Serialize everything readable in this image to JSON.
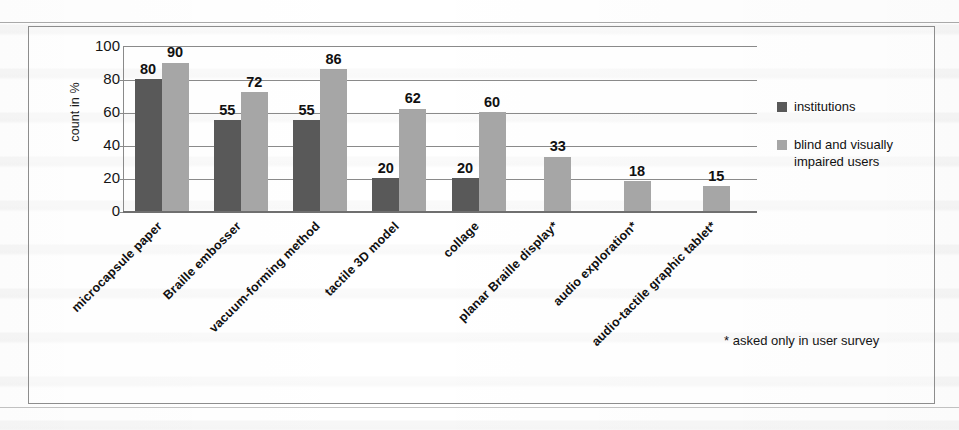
{
  "figure": {
    "footnote": "* asked only in user survey"
  },
  "chart_data": {
    "type": "bar",
    "title": "",
    "xlabel": "",
    "ylabel": "count in %",
    "ylim": [
      0,
      100
    ],
    "yticks": [
      0,
      20,
      40,
      60,
      80,
      100
    ],
    "ytick_labels": [
      "0",
      "20",
      "40",
      "60",
      "80",
      "100"
    ],
    "grid": true,
    "legend_position": "right",
    "categories": [
      "microcapsule paper",
      "Braille embosser",
      "vacuum-forming method",
      "tactile 3D model",
      "collage",
      "planar Braille display*",
      "audio exploration*",
      "audio-tactile graphic tablet*"
    ],
    "series": [
      {
        "name": "institutions",
        "color": "#595959",
        "values": [
          80,
          55,
          55,
          20,
          20,
          null,
          null,
          null
        ],
        "labels": [
          "80",
          "55",
          "55",
          "20",
          "20",
          "",
          "",
          ""
        ]
      },
      {
        "name": "blind and visually impaired users",
        "color": "#a6a6a6",
        "values": [
          90,
          72,
          86,
          62,
          60,
          33,
          18,
          15
        ],
        "labels": [
          "90",
          "72",
          "86",
          "62",
          "60",
          "33",
          "18",
          "15"
        ]
      }
    ]
  }
}
